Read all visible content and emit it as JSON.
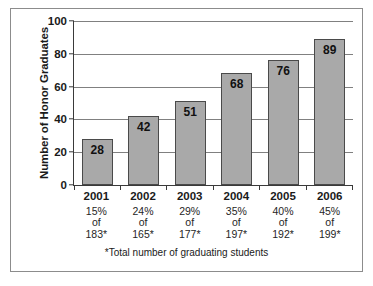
{
  "chart_data": {
    "type": "bar",
    "title": "",
    "xlabel": "",
    "ylabel": "Number of Honor Graduates",
    "categories": [
      "2001",
      "2002",
      "2003",
      "2004",
      "2005",
      "2006"
    ],
    "values": [
      28,
      42,
      51,
      68,
      76,
      89
    ],
    "ylim": [
      0,
      100
    ],
    "yticks": [
      0,
      20,
      40,
      60,
      80,
      100
    ],
    "ytick_labels": [
      "0",
      "20",
      "40",
      "60",
      "80",
      "100"
    ],
    "grid": true,
    "legend": "none",
    "bar_color": "#a9a9a9",
    "bar_edge_color": "#4a4a4a",
    "annotations": [
      {
        "category": "2001",
        "percent": "15%",
        "of": "of",
        "total": "183*"
      },
      {
        "category": "2002",
        "percent": "24%",
        "of": "of",
        "total": "165*"
      },
      {
        "category": "2003",
        "percent": "29%",
        "of": "of",
        "total": "177*"
      },
      {
        "category": "2004",
        "percent": "35%",
        "of": "of",
        "total": "197*"
      },
      {
        "category": "2005",
        "percent": "40%",
        "of": "of",
        "total": "192*"
      },
      {
        "category": "2006",
        "percent": "45%",
        "of": "of",
        "total": "199*"
      }
    ],
    "footnote": "*Total number of graduating students"
  }
}
